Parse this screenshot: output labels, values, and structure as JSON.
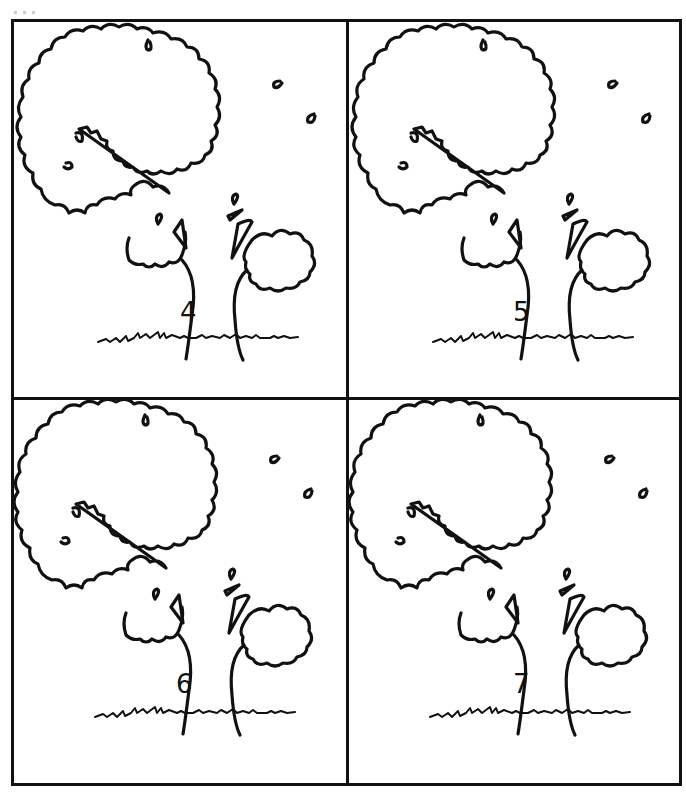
{
  "page": {
    "layout": "2x2 grid of tree cards",
    "border_color": "#111111",
    "background": "#ffffff"
  },
  "cards": [
    {
      "number": "4",
      "position": "top-left"
    },
    {
      "number": "5",
      "position": "top-right"
    },
    {
      "number": "6",
      "position": "bottom-left"
    },
    {
      "number": "7",
      "position": "bottom-right"
    }
  ]
}
